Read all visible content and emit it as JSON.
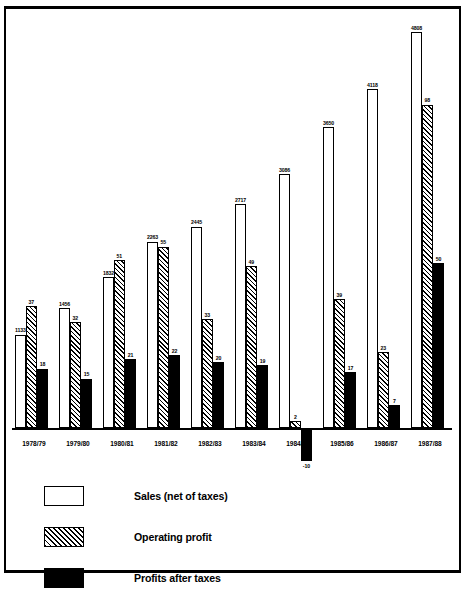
{
  "chart_data": {
    "type": "bar",
    "title": "",
    "subtitle": "",
    "xlabel": "",
    "ylabel": "",
    "grid": false,
    "legend_position": "bottom-left",
    "ylim": [
      -10,
      4800
    ],
    "categories": [
      "1978/79",
      "1979/80",
      "1980/81",
      "1981/82",
      "1982/83",
      "1983/84",
      "1984/85",
      "1985/86",
      "1986/87",
      "1987/88"
    ],
    "series": [
      {
        "name": "Sales (net of taxes)",
        "style": "outline",
        "values": [
          1133,
          1456,
          1832,
          2263,
          2445,
          2717,
          3086,
          3650,
          4118,
          4808
        ]
      },
      {
        "name": "Operating profit",
        "style": "hatched",
        "values": [
          37,
          32,
          51,
          55,
          33,
          49,
          2,
          39,
          23,
          98
        ]
      },
      {
        "name": "Profits after taxes",
        "style": "solid",
        "values": [
          18,
          15,
          21,
          22,
          20,
          19,
          -10,
          17,
          7,
          50
        ]
      }
    ]
  },
  "legend": {
    "items": [
      {
        "label": "Sales (net of taxes)",
        "swatch": "outline-swatch"
      },
      {
        "label": "Operating profit",
        "swatch": "hatched-swatch"
      },
      {
        "label": "Profits after taxes",
        "swatch": "solid-swatch"
      }
    ]
  },
  "colors": {
    "ink": "#000000",
    "paper": "#ffffff"
  }
}
